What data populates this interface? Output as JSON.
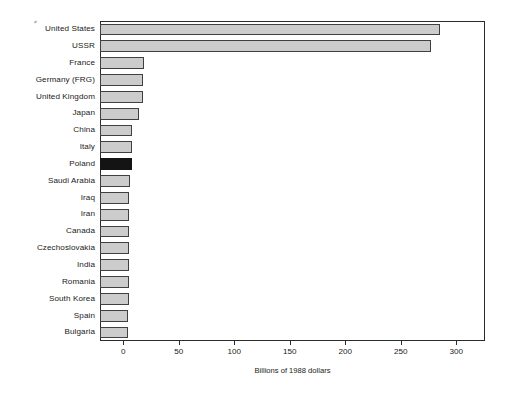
{
  "chart_data": {
    "type": "bar",
    "orientation": "horizontal",
    "title": "",
    "xlabel": "Billions of 1988 dollars",
    "ylabel": "",
    "xlim": [
      -21,
      326
    ],
    "xticks": [
      0,
      50,
      100,
      150,
      200,
      250,
      300,
      350
    ],
    "xtick_labels": [
      "0",
      "50",
      "100",
      "150",
      "200",
      "250",
      "300",
      "350"
    ],
    "grid": false,
    "legend": false,
    "highlight_category": "Poland",
    "highlight_color": "#141414",
    "bar_color": "#cccccc",
    "bar_edge_color": "#404040",
    "categories": [
      "United States",
      "USSR",
      "France",
      "Germany (FRG)",
      "United Kingdom",
      "Japan",
      "China",
      "Italy",
      "Poland",
      "Saudi Arabia",
      "Iraq",
      "Iran",
      "Canada",
      "Czechoslovakia",
      "India",
      "Romania",
      "South Korea",
      "Spain",
      "Bulgaria"
    ],
    "values": [
      285,
      277,
      19,
      18,
      18,
      14,
      8,
      8,
      8,
      6,
      5,
      5,
      5,
      5,
      5,
      5,
      5,
      4,
      4
    ]
  }
}
